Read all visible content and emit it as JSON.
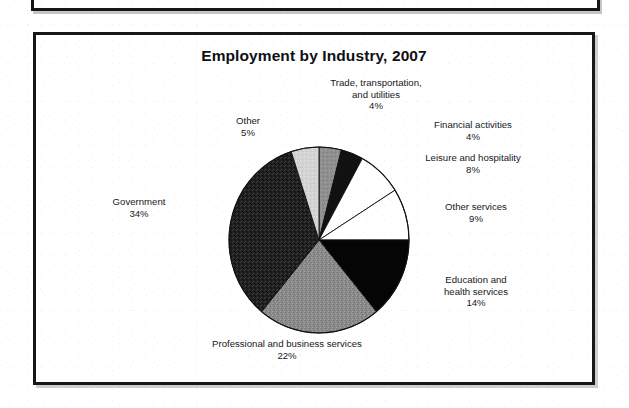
{
  "figure": {
    "title": "Employment by Industry, 2007"
  },
  "chart_data": {
    "type": "pie",
    "title": "Employment by Industry, 2007",
    "xlabel": "",
    "ylabel": "",
    "units": "percent",
    "start_angle_deg": 0,
    "direction": "clockwise",
    "legend": "none (direct labels)",
    "grid": false,
    "total": 100,
    "categories": [
      "Trade, transportation, and utilities",
      "Financial activities",
      "Leisure and hospitality",
      "Other services",
      "Education and health services",
      "Professional and business services",
      "Government",
      "Other"
    ],
    "values": [
      4,
      4,
      8,
      9,
      14,
      22,
      34,
      5
    ],
    "slices": [
      {
        "id": "trade",
        "label_line1": "Trade, transportation,",
        "label_line2": "and utilities",
        "value_text": "4%",
        "value": 4,
        "fill": "#8d8d8d",
        "align": "center"
      },
      {
        "id": "financial",
        "label_line1": "Financial activities",
        "label_line2": "",
        "value_text": "4%",
        "value": 4,
        "fill": "#111111",
        "align": "center"
      },
      {
        "id": "leisure",
        "label_line1": "Leisure and hospitality",
        "label_line2": "",
        "value_text": "8%",
        "value": 8,
        "fill": "#ffffff",
        "align": "center"
      },
      {
        "id": "other-services",
        "label_line1": "Other services",
        "label_line2": "",
        "value_text": "9%",
        "value": 9,
        "fill": "#ffffff",
        "align": "center"
      },
      {
        "id": "education",
        "label_line1": "Education and",
        "label_line2": "health services",
        "value_text": "14%",
        "value": 14,
        "fill": "#050505",
        "align": "center"
      },
      {
        "id": "professional",
        "label_line1": "Professional and business services",
        "label_line2": "",
        "value_text": "22%",
        "value": 22,
        "fill": "#8b8b8b",
        "align": "center"
      },
      {
        "id": "government",
        "label_line1": "Government",
        "label_line2": "",
        "value_text": "34%",
        "value": 34,
        "fill": "#232323",
        "align": "center"
      },
      {
        "id": "other",
        "label_line1": "Other",
        "label_line2": "",
        "value_text": "5%",
        "value": 5,
        "fill": "#d2d2d2",
        "align": "center"
      }
    ],
    "colors": {
      "outline": "#111111",
      "background": "#ffffff",
      "text": "#17181c"
    }
  }
}
